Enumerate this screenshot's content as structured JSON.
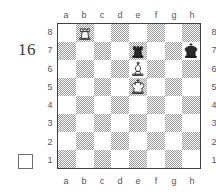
{
  "diagram": {
    "number": "16",
    "side_to_move_indicator": "white-square",
    "files_top": [
      "a",
      "b",
      "c",
      "d",
      "e",
      "f",
      "g",
      "h"
    ],
    "files_bottom": [
      "a",
      "b",
      "c",
      "d",
      "e",
      "f",
      "g",
      "h"
    ],
    "ranks_left": [
      "8",
      "7",
      "6",
      "5",
      "4",
      "3",
      "2",
      "1"
    ],
    "ranks_right": [
      "8",
      "7",
      "6",
      "5",
      "4",
      "3",
      "2",
      "1"
    ],
    "colors": {
      "dark_square": "#9a9a9a",
      "light_square": "#ffffff",
      "border": "#3f3f3f",
      "label": "#555555",
      "number": "#3a3a3a",
      "white_piece_fill": "#ffffff",
      "white_piece_line": "#2b2b2b",
      "black_piece_fill": "#2b2b2b",
      "black_piece_line": "#1a1a1a"
    },
    "pieces": [
      {
        "square": "b8",
        "file": "b",
        "rank": "8",
        "color": "white",
        "type": "rook",
        "icon": "white-rook-icon"
      },
      {
        "square": "e7",
        "file": "e",
        "rank": "7",
        "color": "black",
        "type": "rook",
        "icon": "black-rook-icon"
      },
      {
        "square": "h7",
        "file": "h",
        "rank": "7",
        "color": "black",
        "type": "king",
        "icon": "black-king-icon"
      },
      {
        "square": "e6",
        "file": "e",
        "rank": "6",
        "color": "white",
        "type": "bishop",
        "icon": "white-bishop-icon"
      },
      {
        "square": "e5",
        "file": "e",
        "rank": "5",
        "color": "white",
        "type": "king",
        "icon": "white-king-icon"
      }
    ]
  }
}
